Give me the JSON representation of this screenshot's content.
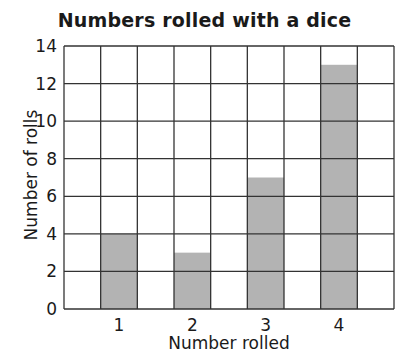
{
  "chart_data": {
    "type": "bar",
    "title": "Numbers rolled with a dice",
    "xlabel": "Number rolled",
    "ylabel": "Number of rolls",
    "categories": [
      "1",
      "2",
      "3",
      "4"
    ],
    "values": [
      4,
      3,
      7,
      13
    ],
    "ylim": [
      0,
      14
    ],
    "yticks": [
      0,
      2,
      4,
      6,
      8,
      10,
      12,
      14
    ],
    "grid": true,
    "bar_color": "#b3b3b3",
    "grid_color": "#333333"
  }
}
